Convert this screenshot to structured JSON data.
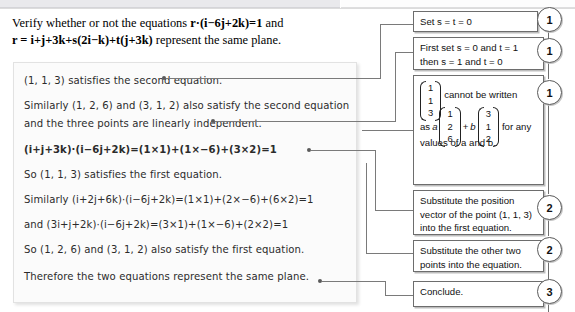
{
  "page": {
    "width": 575,
    "height": 312,
    "background": "#ffffff",
    "accent": "#6d6d6d"
  },
  "question": {
    "line1_pre": "Verify whether or not the equations ",
    "line1_math": "r·(i−6j+2k)=1",
    "line1_post": " and",
    "line2_math": "r = i+j+3k+s(2i−k)+t(j+3k)",
    "line2_post": " represent the same plane."
  },
  "solution": {
    "lines": [
      {
        "id": "l1",
        "text": "(1, 1, 3) satisfies the second equation.",
        "top": 12
      },
      {
        "id": "l2",
        "text": "Similarly (1, 2, 6) and (3, 1, 2) also satisfy the second equation",
        "top": 37
      },
      {
        "id": "l3",
        "text": "and the three points are linearly independent.",
        "top": 55
      },
      {
        "id": "l4",
        "text": "(i+j+3k)·(i−6j+2k)=(1×1)+(1×−6)+(3×2)=1",
        "top": 81
      },
      {
        "id": "l5",
        "text": "So (1, 1, 3) satisfies the first equation.",
        "top": 106
      },
      {
        "id": "l6",
        "text": "Similarly (i+2j+6k)·(i−6j+2k)=(1×1)+(2×−6)+(6×2)=1",
        "top": 131
      },
      {
        "id": "l7",
        "text": "and (3i+j+2k)·(i−6j+2k)=(3×1)+(1×−6)+(2×2)=1",
        "top": 156
      },
      {
        "id": "l8",
        "text": "So (1, 2, 6) and (3, 1, 2) also satisfy the first equation.",
        "top": 181
      },
      {
        "id": "l9",
        "text": "Therefore the two equations represent the same plane.",
        "top": 208
      }
    ]
  },
  "comments": [
    {
      "id": "c1",
      "step": "1",
      "lines": [
        "Set s = t = 0"
      ],
      "italics": [
        "s",
        "t"
      ]
    },
    {
      "id": "c2",
      "step": "1",
      "lines": [
        "First set s = 0 and t = 1",
        "then s = 1 and t = 0"
      ]
    },
    {
      "id": "c3",
      "step": "1",
      "matrix_text": {
        "vec1": [
          "1",
          "1",
          "3"
        ],
        "mid1": "cannot be written",
        "as_label": "as",
        "coef_a": "a",
        "vec2": [
          "1",
          "2",
          "6"
        ],
        "plus": "+",
        "coef_b": "b",
        "vec3": [
          "3",
          "1",
          "2"
        ],
        "tail": "for any",
        "lastline": "values of a and b."
      }
    },
    {
      "id": "c4",
      "step": "2",
      "lines": [
        "Substitute the position",
        "vector of the point (1, 1, 3)",
        "into the first equation."
      ]
    },
    {
      "id": "c5",
      "step": "2",
      "lines": [
        "Substitute the other two",
        "points into the equation."
      ]
    },
    {
      "id": "c6",
      "step": "3",
      "lines": [
        "Conclude."
      ]
    }
  ],
  "step_numbers": [
    "1",
    "1",
    "1",
    "2",
    "2",
    "3"
  ]
}
